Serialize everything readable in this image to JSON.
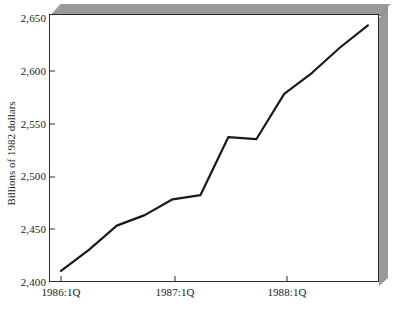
{
  "chart_data": {
    "type": "line",
    "title": "",
    "subtitle": "",
    "xlabel": "",
    "ylabel": "Billions of 1982 dollars",
    "ylim": [
      2400,
      2650
    ],
    "yticks": [
      2400,
      2450,
      2500,
      2550,
      2600,
      2650
    ],
    "ytick_labels": [
      "2,400",
      "2,450",
      "2,500",
      "2,550",
      "2,600",
      "2,650"
    ],
    "xtick_labels": [
      "1986:1Q",
      "1987:1Q",
      "1988:1Q"
    ],
    "xticks": [
      "1986:1Q",
      "1987:1Q",
      "1988:1Q"
    ],
    "grid": false,
    "legend": "none",
    "line_color": "#1a1a1a",
    "categories": [
      "1986:1Q",
      "1986:2Q",
      "1986:3Q",
      "1986:4Q",
      "1987:1Q",
      "1987:2Q",
      "1987:3Q",
      "1987:4Q",
      "1988:1Q",
      "1988:2Q",
      "1988:3Q",
      "1988:4Q"
    ],
    "values": [
      2410,
      2430,
      2453,
      2463,
      2478,
      2482,
      2537,
      2535,
      2578,
      2598,
      2622,
      2643
    ],
    "series": [
      {
        "name": "Billions of 1982 dollars",
        "values": [
          2410,
          2430,
          2453,
          2463,
          2478,
          2482,
          2537,
          2535,
          2578,
          2598,
          2622,
          2643
        ]
      }
    ]
  },
  "figure": {
    "frame_color": "#2a2a2a",
    "shadow_color": "#9a9a9a",
    "background": "#ffffff"
  }
}
